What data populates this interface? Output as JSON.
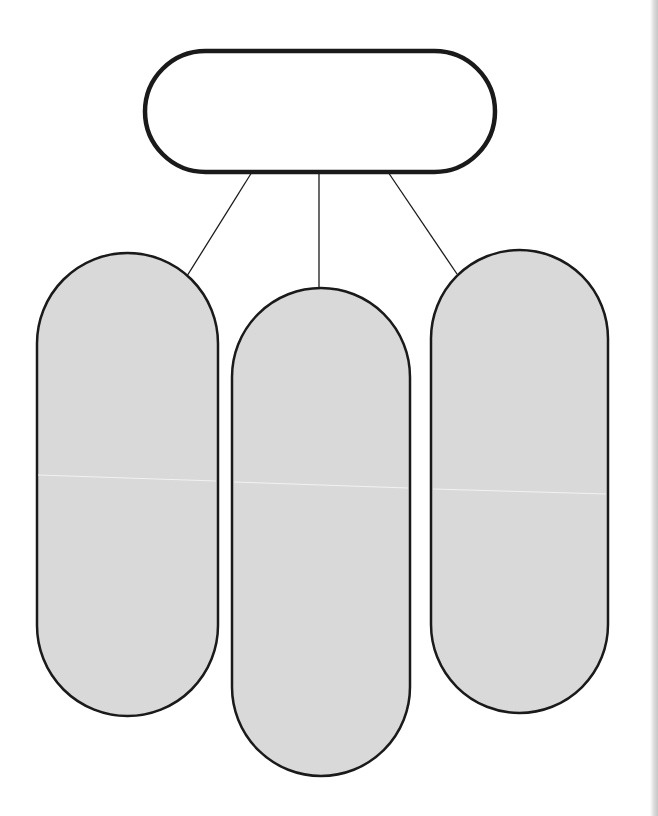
{
  "diagram": {
    "type": "graphic-organizer",
    "layout": "one-to-three hierarchy",
    "root": {
      "label": "",
      "shape": "stadium-horizontal",
      "fill": "#ffffff",
      "stroke": "#1a1a1a"
    },
    "children": [
      {
        "label": "",
        "shape": "stadium-vertical",
        "fill": "#d9d9d9",
        "stroke": "#1a1a1a"
      },
      {
        "label": "",
        "shape": "stadium-vertical",
        "fill": "#d9d9d9",
        "stroke": "#1a1a1a"
      },
      {
        "label": "",
        "shape": "stadium-vertical",
        "fill": "#d9d9d9",
        "stroke": "#1a1a1a"
      }
    ],
    "connector_color": "#1a1a1a",
    "background": "#ffffff"
  }
}
